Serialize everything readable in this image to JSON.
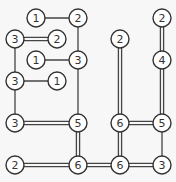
{
  "puzzle": {
    "type": "hashiwokakero",
    "grid": {
      "cols": 8,
      "rows": 8,
      "origin_x": 15,
      "origin_y": 18,
      "spacing": 21
    },
    "colors": {
      "background": "#f7f7f7",
      "node_fill": "#ffffff",
      "stroke": "#333333",
      "bridge": "#444444"
    },
    "nodes": [
      {
        "id": "n0",
        "col": 1,
        "row": 0,
        "value": "1"
      },
      {
        "id": "n1",
        "col": 3,
        "row": 0,
        "value": "2"
      },
      {
        "id": "n2",
        "col": 7,
        "row": 0,
        "value": "2"
      },
      {
        "id": "n3",
        "col": 0,
        "row": 1,
        "value": "3"
      },
      {
        "id": "n4",
        "col": 2,
        "row": 1,
        "value": "2"
      },
      {
        "id": "n5",
        "col": 5,
        "row": 1,
        "value": "2"
      },
      {
        "id": "n6",
        "col": 1,
        "row": 2,
        "value": "1"
      },
      {
        "id": "n7",
        "col": 3,
        "row": 2,
        "value": "3"
      },
      {
        "id": "n8",
        "col": 7,
        "row": 2,
        "value": "4"
      },
      {
        "id": "n9",
        "col": 0,
        "row": 3,
        "value": "3"
      },
      {
        "id": "n10",
        "col": 2,
        "row": 3,
        "value": "1"
      },
      {
        "id": "n11",
        "col": 0,
        "row": 5,
        "value": "3"
      },
      {
        "id": "n12",
        "col": 3,
        "row": 5,
        "value": "5"
      },
      {
        "id": "n13",
        "col": 5,
        "row": 5,
        "value": "6"
      },
      {
        "id": "n14",
        "col": 7,
        "row": 5,
        "value": "5"
      },
      {
        "id": "n15",
        "col": 0,
        "row": 7,
        "value": "2"
      },
      {
        "id": "n16",
        "col": 3,
        "row": 7,
        "value": "6"
      },
      {
        "id": "n17",
        "col": 5,
        "row": 7,
        "value": "6"
      },
      {
        "id": "n18",
        "col": 7,
        "row": 7,
        "value": "3"
      }
    ],
    "bridges": [
      {
        "from": "n0",
        "to": "n1",
        "count": 1
      },
      {
        "from": "n1",
        "to": "n7",
        "count": 1
      },
      {
        "from": "n3",
        "to": "n4",
        "count": 2
      },
      {
        "from": "n3",
        "to": "n9",
        "count": 1
      },
      {
        "from": "n6",
        "to": "n7",
        "count": 1
      },
      {
        "from": "n9",
        "to": "n10",
        "count": 1
      },
      {
        "from": "n7",
        "to": "n12",
        "count": 1
      },
      {
        "from": "n9",
        "to": "n11",
        "count": 1
      },
      {
        "from": "n11",
        "to": "n12",
        "count": 2
      },
      {
        "from": "n12",
        "to": "n16",
        "count": 2
      },
      {
        "from": "n15",
        "to": "n16",
        "count": 2
      },
      {
        "from": "n16",
        "to": "n17",
        "count": 2
      },
      {
        "from": "n17",
        "to": "n18",
        "count": 2
      },
      {
        "from": "n5",
        "to": "n13",
        "count": 2
      },
      {
        "from": "n13",
        "to": "n17",
        "count": 2
      },
      {
        "from": "n13",
        "to": "n14",
        "count": 2
      },
      {
        "from": "n2",
        "to": "n8",
        "count": 2
      },
      {
        "from": "n8",
        "to": "n14",
        "count": 2
      },
      {
        "from": "n14",
        "to": "n18",
        "count": 1
      }
    ]
  }
}
